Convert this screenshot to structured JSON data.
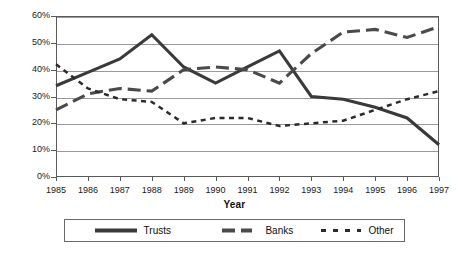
{
  "chart_data": {
    "type": "line",
    "title": "",
    "xlabel": "Year",
    "ylabel": "",
    "x": [
      1985,
      1986,
      1987,
      1988,
      1989,
      1990,
      1991,
      1992,
      1993,
      1994,
      1995,
      1996,
      1997
    ],
    "categories": [
      "1985",
      "1986",
      "1987",
      "1988",
      "1989",
      "1990",
      "1991",
      "1992",
      "1993",
      "1994",
      "1995",
      "1996",
      "1997"
    ],
    "ylim": [
      0,
      60
    ],
    "yticks": [
      0,
      10,
      20,
      30,
      40,
      50,
      60
    ],
    "ytick_labels": [
      "0%",
      "10%",
      "20%",
      "30%",
      "40%",
      "50%",
      "60%"
    ],
    "grid": true,
    "legend_position": "bottom",
    "series": [
      {
        "name": "Trusts",
        "style": "solid",
        "color": "#3a3a3a",
        "values": [
          34,
          39,
          44,
          53,
          41,
          35,
          41,
          47,
          30,
          29,
          26,
          22,
          12
        ]
      },
      {
        "name": "Banks",
        "style": "long-dash",
        "color": "#4a4a4a",
        "values": [
          25,
          31,
          33,
          32,
          40,
          41,
          40,
          35,
          46,
          54,
          55,
          52,
          56
        ]
      },
      {
        "name": "Other",
        "style": "short-dash",
        "color": "#2b2b2b",
        "values": [
          42,
          33,
          29,
          28,
          20,
          22,
          22,
          19,
          20,
          21,
          25,
          29,
          32
        ]
      }
    ]
  },
  "axes": {
    "x_title": "Year"
  },
  "legend": {
    "items": [
      {
        "label": "Trusts"
      },
      {
        "label": "Banks"
      },
      {
        "label": "Other"
      }
    ]
  }
}
